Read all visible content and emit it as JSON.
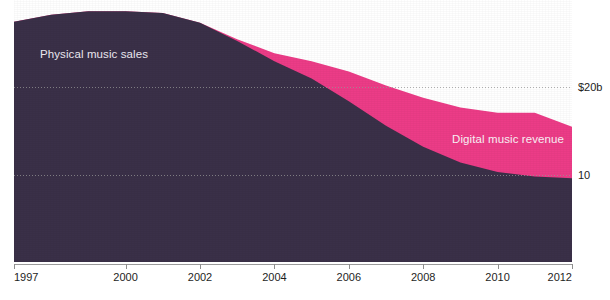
{
  "chart_data": {
    "type": "area",
    "stacked": true,
    "title": "",
    "subtitle": "",
    "xlabel": "",
    "ylabel": "",
    "xlim": [
      1997,
      2012
    ],
    "ylim": [
      0,
      30
    ],
    "grid": "horizontal-dotted",
    "legend_position": "inline-annotation",
    "y_ticks": [
      {
        "value": 20,
        "label": "$20b"
      },
      {
        "value": 10,
        "label": "10"
      }
    ],
    "x_ticks": [
      {
        "value": 1997,
        "label": "1997"
      },
      {
        "value": 2000,
        "label": "2000"
      },
      {
        "value": 2002,
        "label": "2002"
      },
      {
        "value": 2004,
        "label": "2004"
      },
      {
        "value": 2006,
        "label": "2006"
      },
      {
        "value": 2008,
        "label": "2008"
      },
      {
        "value": 2010,
        "label": "2010"
      },
      {
        "value": 2012,
        "label": "2012"
      }
    ],
    "x": [
      1997,
      1998,
      1999,
      2000,
      2001,
      2002,
      2003,
      2004,
      2005,
      2006,
      2007,
      2008,
      2009,
      2010,
      2011,
      2012
    ],
    "series": [
      {
        "name": "Physical music sales",
        "color": "#3a3048",
        "label_color": "#e9e6ee",
        "values": [
          27.5,
          28.3,
          28.7,
          28.7,
          28.5,
          27.4,
          25.3,
          23.0,
          21.0,
          18.4,
          15.6,
          13.2,
          11.4,
          10.3,
          9.8,
          9.6
        ]
      },
      {
        "name": "Digital music revenue",
        "color": "#ec3c87",
        "label_color": "#f6eef2",
        "values": [
          0,
          0,
          0,
          0,
          0,
          0,
          0.2,
          0.9,
          2.0,
          3.4,
          4.6,
          5.6,
          6.3,
          6.8,
          7.3,
          5.9
        ]
      }
    ],
    "annotations": [
      {
        "text": "Physical music sales",
        "x_px": 40,
        "y_px": 48
      },
      {
        "text": "Digital music revenue",
        "x_px": 452,
        "y_px": 133
      }
    ],
    "colors": {
      "physical": "#3a3048",
      "digital": "#ec3c87",
      "background": "#ffffff",
      "gridline": "#969696",
      "axis_text": "#1e1e1e"
    }
  }
}
